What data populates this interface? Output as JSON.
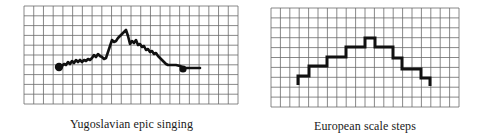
{
  "figure": {
    "panels": [
      {
        "id": "yugoslavian",
        "caption": "Yugoslavian epic singing",
        "grid": {
          "x": 24,
          "y": 6,
          "width": 214,
          "height": 98,
          "cols": 22,
          "rows": 10
        },
        "style": "wavering contour with filled dots at start and end"
      },
      {
        "id": "european",
        "caption": "European scale steps",
        "grid": {
          "x": 271,
          "y": 8,
          "width": 188,
          "height": 99,
          "cols": 20,
          "rows": 10
        },
        "style": "discrete step contour"
      }
    ]
  },
  "chart_data": [
    {
      "type": "line",
      "title": "Yugoslavian epic singing",
      "xlabel": "",
      "ylabel": "",
      "grid": true,
      "note": "melodic contour; values in grid units (rows from bottom, 10 rows total)",
      "x": [
        0,
        1,
        2,
        3,
        4,
        5,
        6,
        7,
        8,
        9,
        10,
        11,
        12,
        13,
        14,
        15,
        16,
        17,
        18
      ],
      "values": [
        3.9,
        4.1,
        4.2,
        4.3,
        4.6,
        4.3,
        5.9,
        6.5,
        7.1,
        6.2,
        6.0,
        5.5,
        5.2,
        4.7,
        4.1,
        4.0,
        3.8,
        3.7,
        3.8
      ]
    },
    {
      "type": "line",
      "title": "European scale steps",
      "xlabel": "",
      "ylabel": "",
      "grid": true,
      "note": "stepped contour; values in grid units (rows from bottom)",
      "x": [
        0,
        1,
        2,
        3,
        4,
        5,
        6,
        7,
        8,
        9
      ],
      "values": [
        3,
        4,
        5,
        6,
        7,
        6,
        5,
        4,
        3,
        2
      ]
    }
  ]
}
